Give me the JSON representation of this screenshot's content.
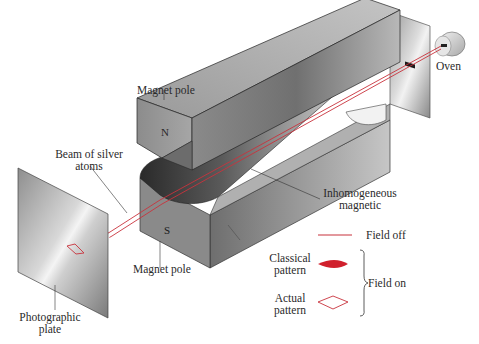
{
  "diagram": {
    "labels": {
      "oven": "Oven",
      "magnet_pole_top": "Magnet pole",
      "magnet_pole_bottom": "Magnet pole",
      "pole_n": "N",
      "pole_s": "S",
      "beam_line1": "Beam of silver",
      "beam_line2": "atoms",
      "field_line1": "Inhomogeneous",
      "field_line2": "magnetic",
      "plate_line1": "Photographic",
      "plate_line2": "plate"
    },
    "legend": {
      "field_off": "Field off",
      "classical_line1": "Classical",
      "classical_line2": "pattern",
      "actual_line1": "Actual",
      "actual_line2": "pattern",
      "field_on": "Field on"
    },
    "colors": {
      "beam": "#c8323c",
      "classical_fill": "#d0202c",
      "magnet_dark": "#3a3a3a",
      "magnet_mid": "#8a8a8a",
      "magnet_light": "#c8c8c8",
      "plate": "#b8b8b8"
    }
  }
}
